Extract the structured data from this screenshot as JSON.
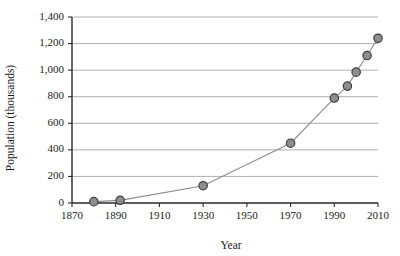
{
  "chart_data": {
    "type": "line",
    "title": "",
    "xlabel": "Year",
    "ylabel": "Population (thousands)",
    "xlim": [
      1870,
      2010
    ],
    "ylim": [
      0,
      1400
    ],
    "xticks": [
      1870,
      1890,
      1910,
      1930,
      1950,
      1970,
      1990,
      2010
    ],
    "xtick_labels": [
      "1870",
      "1890",
      "1910",
      "1930",
      "1950",
      "1970",
      "1990",
      "2010"
    ],
    "yticks": [
      0,
      200,
      400,
      600,
      800,
      1000,
      1200,
      1400
    ],
    "ytick_labels": [
      "0",
      "200",
      "400",
      "600",
      "800",
      "1,000",
      "1,200",
      "1,400"
    ],
    "grid": "horizontal",
    "legend": "none",
    "marker": "circle",
    "marker_color": "#8e8e8e",
    "marker_edge_color": "#3d3d3d",
    "line_color": "#8c8c8c",
    "x": [
      1880,
      1892,
      1930,
      1970,
      1990,
      1996,
      2000,
      2005,
      2010
    ],
    "y": [
      10,
      20,
      130,
      450,
      790,
      880,
      985,
      1110,
      1240
    ],
    "points": [
      {
        "x": 1880,
        "y": 10
      },
      {
        "x": 1892,
        "y": 20
      },
      {
        "x": 1930,
        "y": 130
      },
      {
        "x": 1970,
        "y": 450
      },
      {
        "x": 1990,
        "y": 790
      },
      {
        "x": 1996,
        "y": 880
      },
      {
        "x": 2000,
        "y": 985
      },
      {
        "x": 2005,
        "y": 1110
      },
      {
        "x": 2010,
        "y": 1240
      }
    ]
  }
}
